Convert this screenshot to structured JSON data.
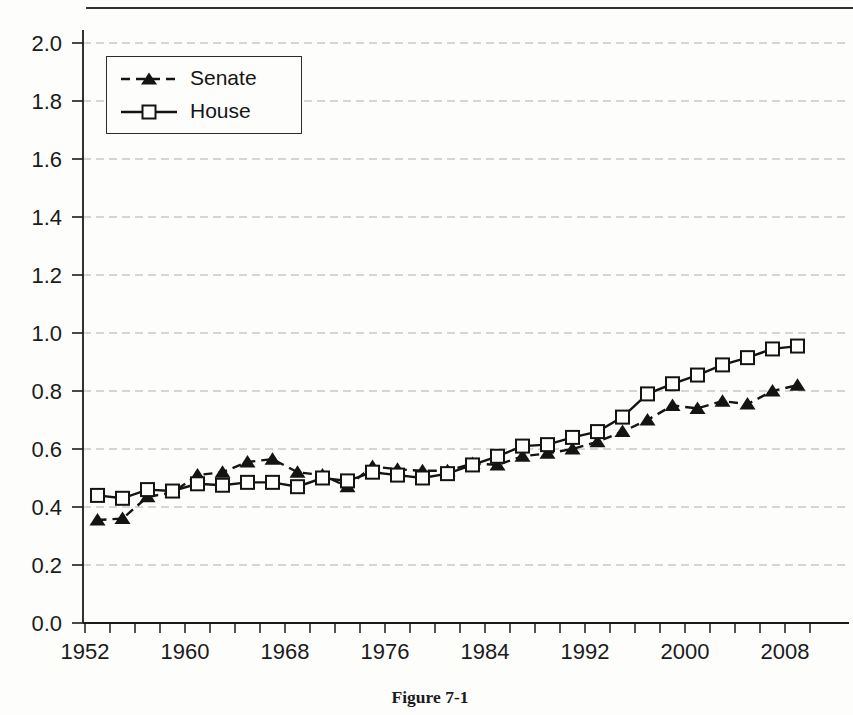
{
  "page": {
    "caption": "Figure 7-1"
  },
  "chart_data": {
    "type": "line",
    "title": "",
    "xlabel": "",
    "ylabel": "",
    "x": [
      1953,
      1955,
      1957,
      1959,
      1961,
      1963,
      1965,
      1967,
      1969,
      1971,
      1973,
      1975,
      1977,
      1979,
      1981,
      1983,
      1985,
      1987,
      1989,
      1991,
      1993,
      1995,
      1997,
      1999,
      2001,
      2003,
      2005,
      2007,
      2009
    ],
    "series": [
      {
        "name": "Senate",
        "line_style": "dashed",
        "marker": "filled-triangle",
        "color": "#141414",
        "values": [
          0.355,
          0.36,
          0.435,
          0.45,
          0.51,
          0.52,
          0.555,
          0.565,
          0.52,
          0.51,
          0.47,
          0.54,
          0.53,
          0.525,
          0.525,
          0.55,
          0.545,
          0.575,
          0.585,
          0.6,
          0.625,
          0.66,
          0.7,
          0.75,
          0.74,
          0.765,
          0.755,
          0.8,
          0.82
        ]
      },
      {
        "name": "House",
        "line_style": "solid",
        "marker": "open-square",
        "color": "#141414",
        "values": [
          0.44,
          0.43,
          0.46,
          0.455,
          0.48,
          0.475,
          0.485,
          0.485,
          0.47,
          0.5,
          0.49,
          0.52,
          0.51,
          0.5,
          0.515,
          0.545,
          0.575,
          0.61,
          0.615,
          0.64,
          0.66,
          0.71,
          0.79,
          0.825,
          0.855,
          0.89,
          0.915,
          0.945,
          0.955
        ]
      }
    ],
    "xlim": [
      1952,
      2010.8
    ],
    "ylim": [
      0,
      2.0
    ],
    "x_major_tick_labels": [
      "1952",
      "1960",
      "1968",
      "1976",
      "1984",
      "1992",
      "2000",
      "2008"
    ],
    "x_minor_tick_step_years": 2,
    "x_tick_range": [
      1952,
      2010
    ],
    "y_tick_labels": [
      "0.0",
      "0.2",
      "0.4",
      "0.6",
      "0.8",
      "1.0",
      "1.2",
      "1.4",
      "1.6",
      "1.8",
      "2.0"
    ],
    "grid": {
      "horizontal": true,
      "style": "dashed",
      "color": "#b0b0b0"
    },
    "legend_position": "top-left",
    "ink_color": "#1b1b1b"
  }
}
